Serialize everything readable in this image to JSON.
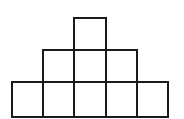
{
  "diagram": {
    "type": "square-pyramid-grid",
    "stroke_color": "#1a1a1a",
    "cell_size": 31,
    "rows": [
      {
        "row": 1,
        "cells": 1,
        "col_start": 2
      },
      {
        "row": 2,
        "cells": 3,
        "col_start": 1
      },
      {
        "row": 3,
        "cells": 5,
        "col_start": 0
      }
    ],
    "total_squares": 9
  }
}
